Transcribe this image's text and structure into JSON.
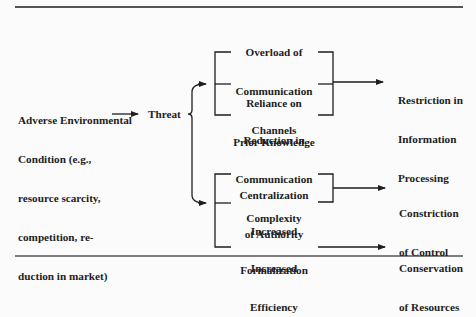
{
  "diagram": {
    "source": {
      "lines": [
        "Adverse Environmental",
        "Condition (e.g.,",
        "resource scarcity,",
        "competition, re-",
        "duction in market)"
      ]
    },
    "threat": {
      "label": "Threat"
    },
    "responses": [
      {
        "lines": [
          "Overload of",
          "Communication",
          "Channels"
        ]
      },
      {
        "lines": [
          "Reliance on",
          "Prior Knowledge"
        ]
      },
      {
        "lines": [
          "Reduction in",
          "Communication",
          "Complexity"
        ]
      },
      {
        "lines": [
          "Centralization",
          "of Authority"
        ]
      },
      {
        "lines": [
          "Increased",
          "Formalization"
        ]
      },
      {
        "lines": [
          "Increased",
          "Efficiency"
        ]
      }
    ],
    "outcomes": [
      {
        "lines": [
          "Restriction in",
          "Information",
          "Processing"
        ]
      },
      {
        "lines": [
          "Constriction",
          "of Control"
        ]
      },
      {
        "lines": [
          "Conservation",
          "of Resources"
        ]
      }
    ]
  }
}
